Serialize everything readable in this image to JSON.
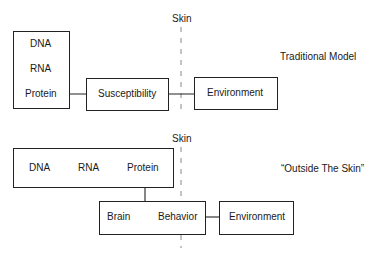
{
  "skin_label": "Skin",
  "traditional": {
    "title": "Traditional Model",
    "gene_chain": [
      "DNA",
      "RNA",
      "Protein"
    ],
    "susceptibility": "Susceptibility",
    "environment": "Environment"
  },
  "outside": {
    "title": "“Outside The Skin”",
    "gene_chain": [
      "DNA",
      "RNA",
      "Protein"
    ],
    "brain": "Brain",
    "behavior": "Behavior",
    "environment": "Environment"
  },
  "colors": {
    "line": "#222222",
    "dashed": "#888888",
    "text": "#1a1a1a"
  }
}
